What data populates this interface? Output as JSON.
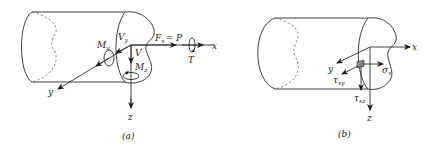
{
  "panels": [
    {
      "id": "a",
      "caption": "(a)",
      "labels": {
        "x_axis": "x",
        "y_axis": "y",
        "z_axis": "z",
        "axial_force": "F",
        "axial_force_sub": "x",
        "axial_force_eq": "= P",
        "torque": "T",
        "shear_y": "V",
        "shear_y_sub": "y",
        "shear_z": "V",
        "moment_y": "M",
        "moment_y_sub": "y",
        "moment_z": "M",
        "moment_z_sub": "z"
      }
    },
    {
      "id": "b",
      "caption": "(b)",
      "labels": {
        "x_axis": "x",
        "y_axis": "y",
        "z_axis": "z",
        "normal_stress": "σ",
        "normal_stress_sub": "x",
        "shear_stress_xy": "τ",
        "shear_stress_xy_sub": "xy",
        "shear_stress_xz": "τ",
        "shear_stress_xz_sub": "xz"
      }
    }
  ],
  "colors": {
    "line": "#2a2a2a",
    "background": "#ffffff"
  }
}
